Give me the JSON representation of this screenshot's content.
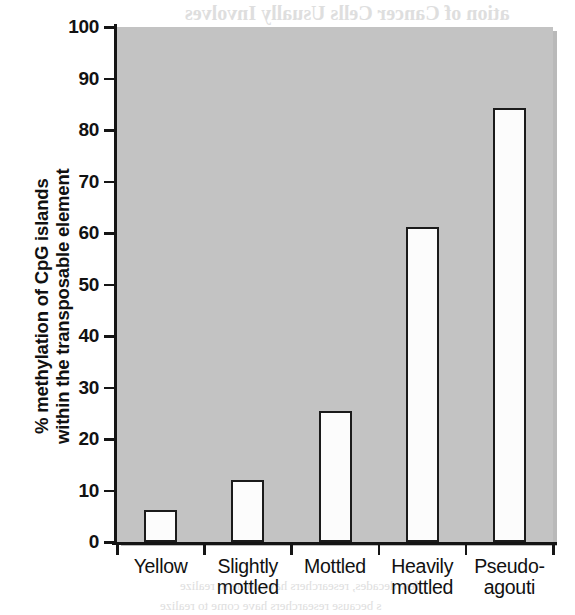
{
  "chart_data": {
    "type": "bar",
    "title": "",
    "subtitle": "",
    "xlabel": "",
    "ylabel": "% methylation of CpG islands within the transposable element",
    "ylabel_lines": [
      "% methylation of CpG islands",
      "within the transposable element"
    ],
    "categories": [
      "Yellow",
      "Slightly mottled",
      "Mottled",
      "Heavily mottled",
      "Pseudo-agouti"
    ],
    "category_lines": [
      [
        "Yellow"
      ],
      [
        "Slightly",
        "mottled"
      ],
      [
        "Mottled"
      ],
      [
        "Heavily",
        "mottled"
      ],
      [
        "Pseudo-",
        "agouti"
      ]
    ],
    "values": [
      6.2,
      12.1,
      25.4,
      61.2,
      84.3
    ],
    "ylim": [
      0,
      100
    ],
    "ytick_labels": [
      "100",
      "90",
      "80",
      "70",
      "60",
      "50",
      "40",
      "30",
      "20",
      "10",
      "0"
    ],
    "ytick_values": [
      100,
      90,
      80,
      70,
      60,
      50,
      40,
      30,
      20,
      10,
      0
    ],
    "grid": false,
    "legend": "none",
    "colors": {
      "bar_fill": "#fcfcfc",
      "bar_edge": "#1b1b1b",
      "plot_background": "#c3c3c3",
      "axis": "#151515",
      "text": "#111111",
      "page_background": "#ffffff"
    }
  },
  "scan_bleed": {
    "lines": [
      {
        "text": "ation of Cancer Cells Usually Involves",
        "x": 185,
        "y": 2,
        "size": 20,
        "bold": true
      },
      {
        "text": "c and epigenetic Changes",
        "x": 212,
        "y": 30,
        "size": 19,
        "bold": true
      },
      {
        "text": "of cancer, like that of other cells, is influenced by their environ",
        "x": 210,
        "y": 62,
        "size": 13,
        "bold": false
      },
      {
        "text": "ese cells are subject to the same kinds of regulatory signals",
        "x": 215,
        "y": 80,
        "size": 13,
        "bold": false
      },
      {
        "text": "ormal cells. There are, however, important differences in th",
        "x": 213,
        "y": 98,
        "size": 13,
        "bold": false
      },
      {
        "text": "patterns between normal and cancer cells. One of the most",
        "x": 212,
        "y": 116,
        "size": 13,
        "bold": false
      },
      {
        "text": "s known for a very long time is that cancer cells express",
        "x": 216,
        "y": 134,
        "size": 13,
        "bold": false
      },
      {
        "text": "at are not present in normal cells",
        "x": 222,
        "y": 152,
        "size": 13,
        "bold": false
      },
      {
        "text": "d changes in gene expression in cancer cells are a conseq",
        "x": 212,
        "y": 183,
        "size": 13,
        "bold": false
      },
      {
        "text": "ne mutations. But there are also important changes in the",
        "x": 214,
        "y": 201,
        "size": 13,
        "bold": false
      },
      {
        "text": "involve epigenetic alterations",
        "x": 224,
        "y": 219,
        "size": 13,
        "bold": false
      },
      {
        "text": "nt of studies has shown that higher activity of genes",
        "x": 220,
        "y": 250,
        "size": 13,
        "bold": false
      },
      {
        "text": "mours is associated with hypomethylation of promoters",
        "x": 212,
        "y": 268,
        "size": 13,
        "bold": false
      },
      {
        "text": "nd of these genes. In contrast, a number of genes",
        "x": 217,
        "y": 286,
        "size": 13,
        "bold": false
      },
      {
        "text": "ssors are silenced in cancer cells, which is effected by",
        "x": 213,
        "y": 304,
        "size": 13,
        "bold": false
      },
      {
        "text": "of their promoters, thereby restricting access from their",
        "x": 214,
        "y": 322,
        "size": 13,
        "bold": false
      },
      {
        "text": "lating factors",
        "x": 226,
        "y": 340,
        "size": 13,
        "bold": false
      },
      {
        "text": "few decades, researchers have come to realize",
        "x": 180,
        "y": 578,
        "size": 13,
        "bold": false
      },
      {
        "text": "s because researchers have come to realize",
        "x": 160,
        "y": 598,
        "size": 13,
        "bold": false
      }
    ]
  }
}
